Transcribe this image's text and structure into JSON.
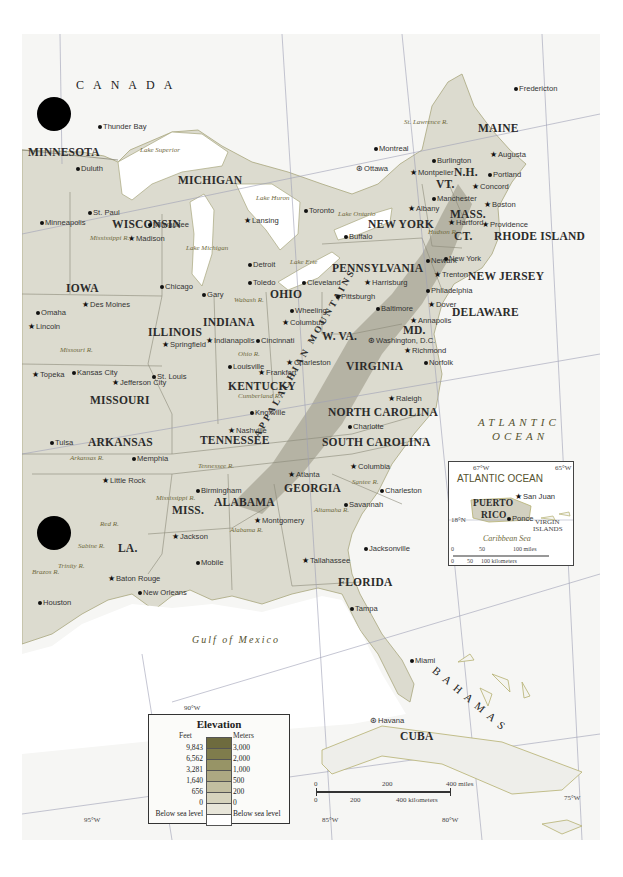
{
  "map": {
    "country_labels": [
      "CANADA",
      "CUBA"
    ],
    "ocean_labels": {
      "atlantic": [
        "ATLANTIC",
        "OCEAN"
      ],
      "gulf": "Gulf of Mexico",
      "bahamas": "BAHAMAS"
    },
    "states": [
      {
        "name": "MINNESOTA",
        "x": 28,
        "y": 150
      },
      {
        "name": "WISCONSIN",
        "x": 112,
        "y": 222
      },
      {
        "name": "MICHIGAN",
        "x": 178,
        "y": 178
      },
      {
        "name": "IOWA",
        "x": 66,
        "y": 286
      },
      {
        "name": "ILLINOIS",
        "x": 148,
        "y": 330
      },
      {
        "name": "INDIANA",
        "x": 203,
        "y": 320
      },
      {
        "name": "OHIO",
        "x": 270,
        "y": 292
      },
      {
        "name": "PENNSYLVANIA",
        "x": 332,
        "y": 266
      },
      {
        "name": "NEW YORK",
        "x": 368,
        "y": 222
      },
      {
        "name": "MAINE",
        "x": 478,
        "y": 126
      },
      {
        "name": "N.H.",
        "x": 454,
        "y": 170
      },
      {
        "name": "VT.",
        "x": 436,
        "y": 182
      },
      {
        "name": "MASS.",
        "x": 450,
        "y": 212
      },
      {
        "name": "CT.",
        "x": 454,
        "y": 234
      },
      {
        "name": "RHODE ISLAND",
        "x": 494,
        "y": 234
      },
      {
        "name": "NEW JERSEY",
        "x": 468,
        "y": 274
      },
      {
        "name": "DELAWARE",
        "x": 452,
        "y": 310
      },
      {
        "name": "MD.",
        "x": 403,
        "y": 328
      },
      {
        "name": "W. VA.",
        "x": 322,
        "y": 334
      },
      {
        "name": "VIRGINIA",
        "x": 346,
        "y": 364
      },
      {
        "name": "KENTUCKY",
        "x": 228,
        "y": 384
      },
      {
        "name": "MISSOURI",
        "x": 90,
        "y": 398
      },
      {
        "name": "ARKANSAS",
        "x": 88,
        "y": 440
      },
      {
        "name": "TENNESSEE",
        "x": 200,
        "y": 438
      },
      {
        "name": "NORTH CAROLINA",
        "x": 328,
        "y": 410
      },
      {
        "name": "SOUTH CAROLINA",
        "x": 322,
        "y": 440
      },
      {
        "name": "GEORGIA",
        "x": 284,
        "y": 486
      },
      {
        "name": "ALABAMA",
        "x": 214,
        "y": 500
      },
      {
        "name": "MISS.",
        "x": 172,
        "y": 508
      },
      {
        "name": "LA.",
        "x": 118,
        "y": 546
      },
      {
        "name": "FLORIDA",
        "x": 338,
        "y": 580
      }
    ],
    "cities": [
      {
        "name": "Thunder Bay",
        "x": 98,
        "y": 126,
        "mark": "dot"
      },
      {
        "name": "Duluth",
        "x": 76,
        "y": 168,
        "mark": "dot"
      },
      {
        "name": "St. Paul",
        "x": 88,
        "y": 212,
        "mark": "dot"
      },
      {
        "name": "Minneapolis",
        "x": 40,
        "y": 222,
        "mark": "dot"
      },
      {
        "name": "Madison",
        "x": 128,
        "y": 238,
        "mark": "star"
      },
      {
        "name": "Milwaukee",
        "x": 148,
        "y": 224,
        "mark": "dot"
      },
      {
        "name": "Lansing",
        "x": 244,
        "y": 220,
        "mark": "star"
      },
      {
        "name": "Detroit",
        "x": 248,
        "y": 264,
        "mark": "dot"
      },
      {
        "name": "Toledo",
        "x": 248,
        "y": 282,
        "mark": "dot"
      },
      {
        "name": "Chicago",
        "x": 160,
        "y": 286,
        "mark": "dot"
      },
      {
        "name": "Gary",
        "x": 202,
        "y": 294,
        "mark": "dot"
      },
      {
        "name": "Cleveland",
        "x": 302,
        "y": 282,
        "mark": "dot"
      },
      {
        "name": "Toronto",
        "x": 304,
        "y": 210,
        "mark": "dot"
      },
      {
        "name": "Buffalo",
        "x": 344,
        "y": 236,
        "mark": "dot"
      },
      {
        "name": "Ottawa",
        "x": 356,
        "y": 168,
        "mark": "cap"
      },
      {
        "name": "Montreal",
        "x": 374,
        "y": 148,
        "mark": "dot"
      },
      {
        "name": "Fredericton",
        "x": 514,
        "y": 88,
        "mark": "dot"
      },
      {
        "name": "Burlington",
        "x": 432,
        "y": 160,
        "mark": "dot"
      },
      {
        "name": "Montpelier",
        "x": 410,
        "y": 172,
        "mark": "star"
      },
      {
        "name": "Augusta",
        "x": 490,
        "y": 154,
        "mark": "star"
      },
      {
        "name": "Portland",
        "x": 488,
        "y": 174,
        "mark": "dot"
      },
      {
        "name": "Concord",
        "x": 472,
        "y": 186,
        "mark": "star"
      },
      {
        "name": "Manchester",
        "x": 432,
        "y": 198,
        "mark": "dot"
      },
      {
        "name": "Boston",
        "x": 484,
        "y": 204,
        "mark": "star"
      },
      {
        "name": "Albany",
        "x": 408,
        "y": 208,
        "mark": "star"
      },
      {
        "name": "Hartford",
        "x": 448,
        "y": 222,
        "mark": "star"
      },
      {
        "name": "Providence",
        "x": 482,
        "y": 224,
        "mark": "star"
      },
      {
        "name": "Newark",
        "x": 426,
        "y": 260,
        "mark": "dot"
      },
      {
        "name": "New York",
        "x": 444,
        "y": 258,
        "mark": "dot"
      },
      {
        "name": "Trenton",
        "x": 434,
        "y": 274,
        "mark": "star"
      },
      {
        "name": "Philadelphia",
        "x": 426,
        "y": 290,
        "mark": "dot"
      },
      {
        "name": "Harrisburg",
        "x": 364,
        "y": 282,
        "mark": "star"
      },
      {
        "name": "Pittsburgh",
        "x": 336,
        "y": 296,
        "mark": "dot"
      },
      {
        "name": "Baltimore",
        "x": 376,
        "y": 308,
        "mark": "dot"
      },
      {
        "name": "Dover",
        "x": 428,
        "y": 304,
        "mark": "star"
      },
      {
        "name": "Annapolis",
        "x": 410,
        "y": 320,
        "mark": "star"
      },
      {
        "name": "Washington, D.C.",
        "x": 368,
        "y": 340,
        "mark": "cap"
      },
      {
        "name": "Wheeling",
        "x": 290,
        "y": 310,
        "mark": "dot"
      },
      {
        "name": "Columbus",
        "x": 282,
        "y": 322,
        "mark": "star"
      },
      {
        "name": "Cincinnati",
        "x": 256,
        "y": 340,
        "mark": "dot"
      },
      {
        "name": "Charleston",
        "x": 286,
        "y": 362,
        "mark": "star"
      },
      {
        "name": "Richmond",
        "x": 404,
        "y": 350,
        "mark": "star"
      },
      {
        "name": "Norfolk",
        "x": 424,
        "y": 362,
        "mark": "dot"
      },
      {
        "name": "Indianapolis",
        "x": 206,
        "y": 340,
        "mark": "star"
      },
      {
        "name": "Springfield",
        "x": 162,
        "y": 344,
        "mark": "star"
      },
      {
        "name": "Louisville",
        "x": 228,
        "y": 366,
        "mark": "dot"
      },
      {
        "name": "Frankfort",
        "x": 258,
        "y": 372,
        "mark": "star"
      },
      {
        "name": "Des Moines",
        "x": 82,
        "y": 304,
        "mark": "star"
      },
      {
        "name": "Omaha",
        "x": 36,
        "y": 312,
        "mark": "dot"
      },
      {
        "name": "Lincoln",
        "x": 28,
        "y": 326,
        "mark": "star"
      },
      {
        "name": "Topeka",
        "x": 32,
        "y": 374,
        "mark": "star"
      },
      {
        "name": "Kansas City",
        "x": 72,
        "y": 372,
        "mark": "dot"
      },
      {
        "name": "Jefferson City",
        "x": 112,
        "y": 382,
        "mark": "star"
      },
      {
        "name": "St. Louis",
        "x": 152,
        "y": 376,
        "mark": "dot"
      },
      {
        "name": "Knoxville",
        "x": 250,
        "y": 412,
        "mark": "dot"
      },
      {
        "name": "Nashville",
        "x": 228,
        "y": 430,
        "mark": "star"
      },
      {
        "name": "Raleigh",
        "x": 388,
        "y": 398,
        "mark": "star"
      },
      {
        "name": "Charlotte",
        "x": 348,
        "y": 426,
        "mark": "dot"
      },
      {
        "name": "Columbia",
        "x": 350,
        "y": 466,
        "mark": "star"
      },
      {
        "name": "Charleston",
        "x": 380,
        "y": 490,
        "mark": "dot"
      },
      {
        "name": "Atlanta",
        "x": 288,
        "y": 474,
        "mark": "star"
      },
      {
        "name": "Savannah",
        "x": 344,
        "y": 504,
        "mark": "dot"
      },
      {
        "name": "Tulsa",
        "x": 50,
        "y": 442,
        "mark": "dot"
      },
      {
        "name": "Memphia",
        "x": 132,
        "y": 458,
        "mark": "dot"
      },
      {
        "name": "Little Rock",
        "x": 102,
        "y": 480,
        "mark": "star"
      },
      {
        "name": "Birmingham",
        "x": 196,
        "y": 490,
        "mark": "dot"
      },
      {
        "name": "Montgomery",
        "x": 254,
        "y": 520,
        "mark": "star"
      },
      {
        "name": "Jackson",
        "x": 172,
        "y": 536,
        "mark": "star"
      },
      {
        "name": "Mobile",
        "x": 196,
        "y": 562,
        "mark": "dot"
      },
      {
        "name": "Baton Rouge",
        "x": 108,
        "y": 578,
        "mark": "star"
      },
      {
        "name": "New Orleans",
        "x": 138,
        "y": 592,
        "mark": "dot"
      },
      {
        "name": "Houston",
        "x": 38,
        "y": 602,
        "mark": "dot"
      },
      {
        "name": "Tallahassee",
        "x": 302,
        "y": 560,
        "mark": "star"
      },
      {
        "name": "Jacksonville",
        "x": 364,
        "y": 548,
        "mark": "dot"
      },
      {
        "name": "Tampa",
        "x": 350,
        "y": 608,
        "mark": "dot"
      },
      {
        "name": "Miami",
        "x": 410,
        "y": 660,
        "mark": "dot"
      },
      {
        "name": "Havana",
        "x": 370,
        "y": 720,
        "mark": "cap"
      }
    ],
    "water_features": [
      {
        "name": "Lake Superior",
        "x": 140,
        "y": 150
      },
      {
        "name": "Lake Michigan",
        "x": 186,
        "y": 248
      },
      {
        "name": "Lake Huron",
        "x": 256,
        "y": 198
      },
      {
        "name": "Lake Ontario",
        "x": 338,
        "y": 214
      },
      {
        "name": "Lake Erie",
        "x": 290,
        "y": 262
      },
      {
        "name": "St. Lawrence R.",
        "x": 404,
        "y": 122
      },
      {
        "name": "Hudson R.",
        "x": 428,
        "y": 232
      },
      {
        "name": "Mississippi R.",
        "x": 90,
        "y": 238
      },
      {
        "name": "Missouri R.",
        "x": 60,
        "y": 350
      },
      {
        "name": "Wabash R.",
        "x": 234,
        "y": 300
      },
      {
        "name": "Ohio R.",
        "x": 238,
        "y": 354
      },
      {
        "name": "Cumberland R.",
        "x": 238,
        "y": 396
      },
      {
        "name": "Arkansas R.",
        "x": 70,
        "y": 458
      },
      {
        "name": "Tennessee R.",
        "x": 198,
        "y": 466
      },
      {
        "name": "Mississippi R.",
        "x": 156,
        "y": 498
      },
      {
        "name": "Red R.",
        "x": 100,
        "y": 524
      },
      {
        "name": "Sabine R.",
        "x": 78,
        "y": 546
      },
      {
        "name": "Trinity R.",
        "x": 58,
        "y": 566
      },
      {
        "name": "Brazos R.",
        "x": 32,
        "y": 572
      },
      {
        "name": "Alabama R.",
        "x": 230,
        "y": 530
      },
      {
        "name": "Altamaha R.",
        "x": 314,
        "y": 510
      },
      {
        "name": "Santee R.",
        "x": 352,
        "y": 482
      }
    ],
    "mountains": "APPALACHIAN MOUNTAINS",
    "graticule": {
      "labels": [
        "90°W",
        "95°W",
        "85°W",
        "80°W",
        "75°W"
      ]
    }
  },
  "legend": {
    "title": "Elevation",
    "feet_label": "Feet",
    "meters_label": "Meters",
    "rows": [
      {
        "feet": "9,843",
        "meters": "3,000",
        "color": "#7f7c4c"
      },
      {
        "feet": "6,562",
        "meters": "2,000",
        "color": "#979466"
      },
      {
        "feet": "3,281",
        "meters": "1,000",
        "color": "#ada882"
      },
      {
        "feet": "1,640",
        "meters": "500",
        "color": "#c2bea0"
      },
      {
        "feet": "656",
        "meters": "200",
        "color": "#d6d3bd"
      },
      {
        "feet": "0",
        "meters": "0",
        "color": "#e8e6da"
      },
      {
        "feet": "Below sea level",
        "meters": "Below sea level",
        "color": "#ffffff"
      }
    ],
    "top_color": "#6e6b3e"
  },
  "scale_bar": {
    "miles": [
      "0",
      "200",
      "400 miles"
    ],
    "kilometers": [
      "0",
      "200",
      "400 kilometers"
    ]
  },
  "inset": {
    "title": "ATLANTIC OCEAN",
    "lon_left": "67°W",
    "lon_right": "65°W",
    "lat": "18°N",
    "island": [
      "PUERTO",
      "RICO"
    ],
    "cities": [
      "San Juan",
      "Ponce"
    ],
    "virgin_islands": [
      "VIRGIN",
      "ISLANDS"
    ],
    "sea": "Caribbean Sea",
    "scale_miles": [
      "0",
      "50",
      "100 miles"
    ],
    "scale_km": [
      "0",
      "50",
      "100 kilometers"
    ]
  },
  "colors": {
    "land": "#dcdbcf",
    "land_dark": "#b9b8a8",
    "water": "#ffffff",
    "foreign_land": "#f3f3f1",
    "river": "#b5b070",
    "border": "#8c8a78"
  }
}
